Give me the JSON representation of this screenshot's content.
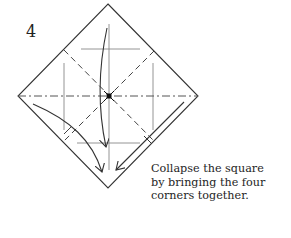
{
  "step": {
    "number": "4"
  },
  "caption": {
    "lines": [
      "Collapse the square",
      "by bringing the four",
      "corners together."
    ]
  },
  "diagram": {
    "square": {
      "top": [
        108,
        4
      ],
      "right": [
        198,
        96
      ],
      "bottom": [
        108,
        188
      ],
      "left": [
        18,
        96
      ]
    },
    "center": [
      109,
      96
    ],
    "line_color": "#333333",
    "light_line_color": "#777777"
  }
}
